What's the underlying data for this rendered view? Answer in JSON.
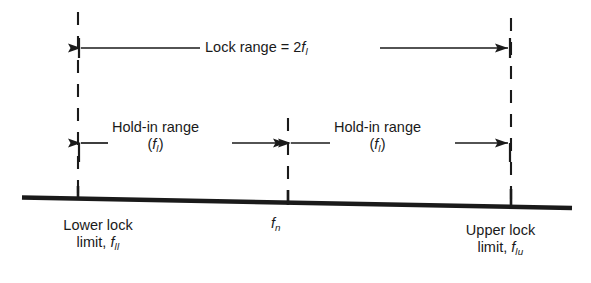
{
  "diagram": {
    "background_color": "#ffffff",
    "line_color": "#1a1a1a",
    "labels": {
      "lock_range": {
        "text": "Lock range = 2",
        "symbol": "f",
        "subscript": "l"
      },
      "holdin_left": {
        "line1": "Hold-in range",
        "paren_open": "(",
        "symbol": "f",
        "subscript": "l",
        "paren_close": ")"
      },
      "holdin_right": {
        "line1": "Hold-in range",
        "paren_open": "(",
        "symbol": "f",
        "subscript": "l",
        "paren_close": ")"
      },
      "center_frequency": {
        "symbol": "f",
        "subscript": "n"
      },
      "lower_limit": {
        "line1": "Lower lock",
        "line2_prefix": "limit, ",
        "symbol": "f",
        "subscript": "ll"
      },
      "upper_limit": {
        "line1": "Upper lock",
        "line2_prefix": "limit, ",
        "symbol": "f",
        "subscript": "lu"
      }
    },
    "markers": {
      "lower_lock_x": 78,
      "center_x": 288,
      "upper_lock_x": 511
    },
    "rows": {
      "lock_range_arrow_y": 48,
      "holdin_arrow_y": 143,
      "baseline_left_y": 198,
      "baseline_right_y": 207
    }
  }
}
